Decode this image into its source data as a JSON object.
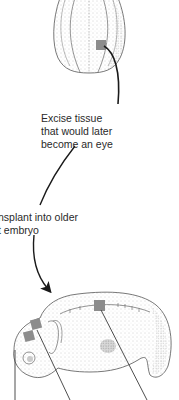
{
  "figure": {
    "type": "biology-illustration",
    "colors": {
      "background": "#ffffff",
      "outline": "#555555",
      "stipple": "#9a9a9a",
      "graft_patch": "#8c8c8c",
      "arrow": "#1a1a1a",
      "text": "#2a2a2a"
    }
  },
  "labels": {
    "excise": {
      "lines": [
        "Excise tissue",
        "that would later",
        "become an eye"
      ]
    },
    "transplant": {
      "lines": [
        "nsplant into older",
        "t embryo"
      ]
    }
  },
  "elements": {
    "donor_embryo": {
      "description": "young embryo, top view, with excised patch"
    },
    "host_embryo": {
      "description": "older embryo, side view, with three graft sites"
    },
    "graft_sites": [
      "head-anterior",
      "head-posterior",
      "dorsal-trunk"
    ]
  }
}
